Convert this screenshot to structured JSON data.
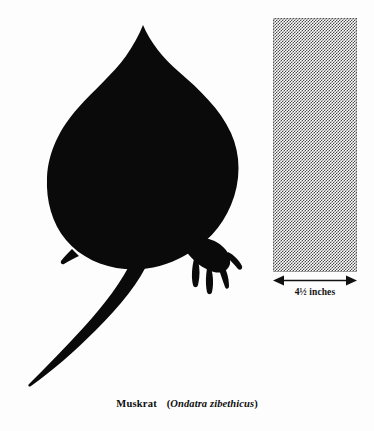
{
  "figure": {
    "kind": "natural-history-plate",
    "background_color": "#fdfdfd"
  },
  "silhouette": {
    "subject": "muskrat-track-silhouette",
    "fill_color": "#0a0a0a",
    "description": "Solid black teardrop-shaped body with a clawed hind foot at lower right, a small foot notch at lower left, and a long tapering tail sweeping to the lower left."
  },
  "scale": {
    "swatch_name": "scale-swatch",
    "swatch_fill": "#4a4a4a",
    "pattern": "50-percent-checkerboard-dither",
    "arrow_name": "double-headed-arrow",
    "arrow_color": "#111111",
    "measurement_value": "4½",
    "measurement_unit": "inches",
    "label": "4½ inches"
  },
  "caption": {
    "common_name": "Muskrat",
    "open_paren": "(",
    "scientific_name": "Ondatra zibethicus",
    "close_paren": ")",
    "full_text": "Muskrat (Ondatra zibethicus)"
  }
}
